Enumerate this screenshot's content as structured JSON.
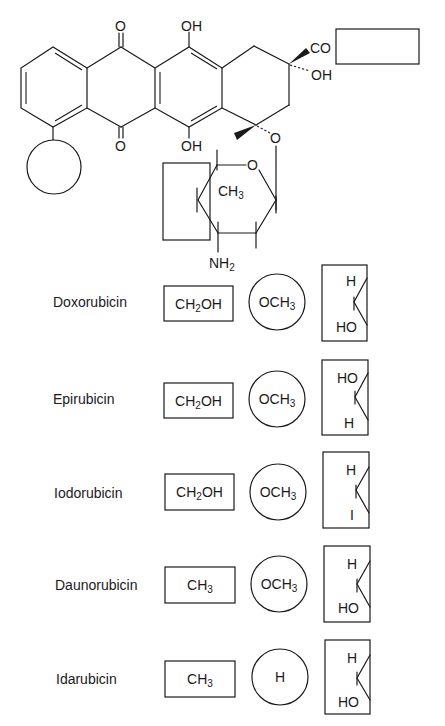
{
  "figure": {
    "core": {
      "top_carbonyl_o": "O",
      "bottom_carbonyl_o": "O",
      "top_oh": "OH",
      "bottom_oh": "OH",
      "side_chain_co": "CO",
      "c9_oh": "OH",
      "glycosidic_o": "O",
      "ring_o": "O",
      "sugar_methyl": "CH",
      "sugar_methyl_sub": "3",
      "sugar_amine": "NH",
      "sugar_amine_sub": "2"
    },
    "substituent_placeholders": {
      "r1": "box-right-of-CO",
      "r2": "circle-ring-A",
      "r3": "box-sugar-C4"
    }
  },
  "compounds": [
    {
      "name": "Doxorubicin",
      "r1": {
        "main": "CH",
        "sub": "2",
        "tail": "OH"
      },
      "r2": {
        "main": "OCH",
        "sub": "3",
        "tail": ""
      },
      "r3": {
        "top": "H",
        "bottom": "HO"
      }
    },
    {
      "name": "Epirubicin",
      "r1": {
        "main": "CH",
        "sub": "2",
        "tail": "OH"
      },
      "r2": {
        "main": "OCH",
        "sub": "3",
        "tail": ""
      },
      "r3": {
        "top": "HO",
        "bottom": "H"
      }
    },
    {
      "name": "Iodorubicin",
      "r1": {
        "main": "CH",
        "sub": "2",
        "tail": "OH"
      },
      "r2": {
        "main": "OCH",
        "sub": "3",
        "tail": ""
      },
      "r3": {
        "top": "H",
        "bottom": "I"
      }
    },
    {
      "name": "Daunorubicin",
      "r1": {
        "main": "CH",
        "sub": "3",
        "tail": ""
      },
      "r2": {
        "main": "OCH",
        "sub": "3",
        "tail": ""
      },
      "r3": {
        "top": "H",
        "bottom": "HO"
      }
    },
    {
      "name": "Idarubicin",
      "r1": {
        "main": "CH",
        "sub": "3",
        "tail": ""
      },
      "r2": {
        "main": "H",
        "sub": "",
        "tail": ""
      },
      "r3": {
        "top": "H",
        "bottom": "HO"
      }
    }
  ]
}
